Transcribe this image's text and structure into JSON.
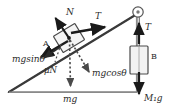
{
  "figure": {
    "type": "free-body-diagram",
    "background_color": "#ffffff",
    "line_color": "#3a3a3a",
    "incline_fill": "#ffffff",
    "block_fill": "#f2f2f2",
    "arrow_color": "#1a1a1a",
    "dotted_color": "#4a4a4a"
  },
  "labels": {
    "normal_force": "N",
    "tension_incline": "T",
    "tension_vertical": "T",
    "gravity_component_parallel": "mgsinθ",
    "gravity_component_perpendicular": "mgcosθ",
    "friction": "μN",
    "weight_block_a": "mg",
    "weight_block_b": "M₁g",
    "block_a": "A",
    "block_b": "B"
  },
  "geometry": {
    "incline_apex": [
      137,
      14
    ],
    "incline_left_vertex": [
      9,
      92
    ],
    "incline_base_right": [
      137,
      92
    ],
    "pulley_center": [
      138,
      12
    ],
    "pulley_radius": 5,
    "block_a_center": [
      69,
      38
    ],
    "block_b_rect": [
      130,
      46,
      18,
      28
    ]
  },
  "vectors": [
    {
      "name": "normal-force",
      "label": "N",
      "from": [
        69,
        38
      ],
      "to": [
        55,
        17
      ],
      "style": "solid"
    },
    {
      "name": "tension-incline",
      "label": "T",
      "from": [
        70,
        33
      ],
      "to": [
        106,
        27
      ],
      "style": "solid"
    },
    {
      "name": "gravity-parallel",
      "label": "mgsinθ",
      "from": [
        69,
        38
      ],
      "to": [
        40,
        55
      ],
      "style": "solid"
    },
    {
      "name": "weight-total",
      "label": "mg",
      "from": [
        69,
        38
      ],
      "to": [
        71,
        88
      ],
      "style": "dotted"
    },
    {
      "name": "gravity-perpendicular",
      "label": "mgcosθ",
      "from": [
        69,
        38
      ],
      "to": [
        90,
        73
      ],
      "style": "dotted"
    },
    {
      "name": "friction",
      "label": "μN",
      "from": [
        62,
        45
      ],
      "to": [
        41,
        60
      ],
      "style": "solid"
    },
    {
      "name": "tension-vertical",
      "label": "T",
      "from": [
        139,
        44
      ],
      "to": [
        139,
        22
      ],
      "style": "solid"
    },
    {
      "name": "weight-hanging",
      "label": "M₁g",
      "from": [
        139,
        70
      ],
      "to": [
        139,
        95
      ],
      "style": "solid"
    }
  ]
}
